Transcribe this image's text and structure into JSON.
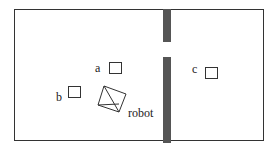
{
  "diagram": {
    "labels": {
      "a": "a",
      "b": "b",
      "c": "c",
      "robot": "robot"
    },
    "colors": {
      "wall": "#555555",
      "outline": "#333333"
    }
  }
}
